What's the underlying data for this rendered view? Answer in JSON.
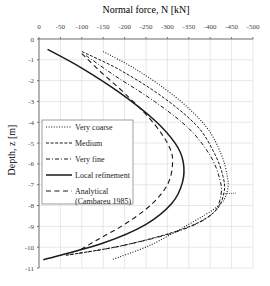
{
  "chart_data": {
    "type": "line",
    "title": "Normal force, N [kN]",
    "xlabel": "Normal force, N [kN]",
    "ylabel": "Depth, z [m]",
    "xlim": [
      0,
      -500
    ],
    "ylim": [
      0,
      -11
    ],
    "x_ticks": [
      "0",
      "-50",
      "-100",
      "-150",
      "-200",
      "-250",
      "-300",
      "-350",
      "-400",
      "-450",
      "-500"
    ],
    "y_ticks": [
      "0",
      "-1",
      "-2",
      "-3",
      "-4",
      "-5",
      "-6",
      "-7",
      "-8",
      "-9",
      "-10",
      "-11"
    ],
    "grid": true,
    "legend_position": "inside-left-middle",
    "series": [
      {
        "name": "Very coarse",
        "style": "dotted",
        "points": [
          [
            -150,
            -0.6
          ],
          [
            -230,
            -1.5
          ],
          [
            -320,
            -2.8
          ],
          [
            -390,
            -4.2
          ],
          [
            -425,
            -5.5
          ],
          [
            -440,
            -6.6
          ],
          [
            -440,
            -7.3
          ],
          [
            -420,
            -8.0
          ],
          [
            -350,
            -8.9
          ],
          [
            -260,
            -9.9
          ],
          [
            -170,
            -10.6
          ]
        ]
      },
      {
        "name": "Medium",
        "style": "dashed",
        "points": [
          [
            -100,
            -0.6
          ],
          [
            -190,
            -1.5
          ],
          [
            -290,
            -2.8
          ],
          [
            -370,
            -4.2
          ],
          [
            -410,
            -5.5
          ],
          [
            -430,
            -6.6
          ],
          [
            -432,
            -7.4
          ],
          [
            -410,
            -8.3
          ],
          [
            -340,
            -9.1
          ],
          [
            -200,
            -9.9
          ],
          [
            -60,
            -10.4
          ]
        ]
      },
      {
        "name": "Very fine",
        "style": "dash-dot",
        "points": [
          [
            -110,
            -0.8
          ],
          [
            -180,
            -1.8
          ],
          [
            -270,
            -3.0
          ],
          [
            -350,
            -4.3
          ],
          [
            -400,
            -5.6
          ],
          [
            -422,
            -6.7
          ],
          [
            -425,
            -7.5
          ],
          [
            -405,
            -8.4
          ],
          [
            -330,
            -9.2
          ],
          [
            -190,
            -9.95
          ],
          [
            -60,
            -10.4
          ]
        ]
      },
      {
        "name": "Local refinement",
        "style": "solid",
        "points": [
          [
            -20,
            -0.5
          ],
          [
            -100,
            -1.4
          ],
          [
            -190,
            -2.6
          ],
          [
            -270,
            -3.9
          ],
          [
            -318,
            -5.0
          ],
          [
            -337,
            -5.9
          ],
          [
            -335,
            -6.9
          ],
          [
            -310,
            -7.9
          ],
          [
            -250,
            -8.9
          ],
          [
            -150,
            -9.8
          ],
          [
            -10,
            -10.6
          ]
        ]
      },
      {
        "name": "Analytical (Cambareu 1985)",
        "style": "long-dash",
        "points": [
          [
            -100,
            -0.7
          ],
          [
            -140,
            -1.5
          ],
          [
            -210,
            -2.8
          ],
          [
            -270,
            -4.1
          ],
          [
            -305,
            -5.2
          ],
          [
            -312,
            -6.0
          ],
          [
            -300,
            -7.0
          ],
          [
            -260,
            -8.0
          ],
          [
            -200,
            -8.9
          ],
          [
            -140,
            -9.6
          ],
          [
            -90,
            -10.2
          ]
        ]
      }
    ]
  },
  "legend": {
    "items": [
      {
        "label": "Very coarse"
      },
      {
        "label": "Medium"
      },
      {
        "label": "Very fine"
      },
      {
        "label": "Local refinement"
      },
      {
        "label": "Analytical",
        "label2": "(Cambareu 1985)"
      }
    ]
  }
}
